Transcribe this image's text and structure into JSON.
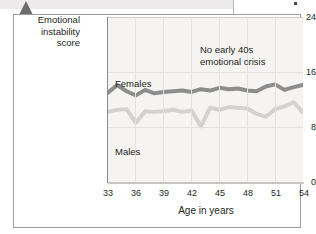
{
  "figure": {
    "y_axis_title_lines": [
      "Emotional",
      "instability",
      "score"
    ],
    "x_axis_label": "Age in years",
    "annotation_lines": [
      "No early 40s",
      "emotional crisis"
    ],
    "series_label_females": "Females",
    "series_label_males": "Males"
  },
  "colors": {
    "females_line": "#8d8d8d",
    "males_line": "#d3d2d0",
    "plot_background": "#f5f4f3",
    "gridline": "#e3e1df",
    "axis": "#8a8a8a",
    "frame": "#9d9d9d",
    "pointer": "#6c6c6c",
    "top_band": "#eceaea",
    "text": "#231f20"
  },
  "chart_data": {
    "type": "line",
    "title": "",
    "xlabel": "Age in years",
    "ylabel": "Emotional instability score",
    "xlim": [
      33,
      54
    ],
    "ylim": [
      0,
      24
    ],
    "yticks": [
      0,
      8,
      16,
      24
    ],
    "xticks": [
      33,
      36,
      39,
      42,
      45,
      48,
      51,
      54
    ],
    "grid": true,
    "legend": "inline-labels",
    "annotations": [
      {
        "text": "No early 40s emotional crisis",
        "x": 45.5,
        "y": 20.5
      }
    ],
    "x": [
      33,
      34,
      35,
      36,
      37,
      38,
      39,
      40,
      41,
      42,
      43,
      44,
      45,
      46,
      47,
      48,
      49,
      50,
      51,
      52,
      53,
      54
    ],
    "series": [
      {
        "name": "Females",
        "color": "#8d8d8d",
        "values": [
          13.0,
          14.1,
          13.2,
          12.6,
          13.4,
          12.9,
          13.1,
          13.2,
          13.3,
          13.1,
          13.5,
          13.3,
          13.7,
          13.5,
          13.6,
          13.3,
          13.2,
          13.9,
          14.2,
          13.4,
          13.8,
          14.1
        ]
      },
      {
        "name": "Males",
        "color": "#d3d2d0",
        "values": [
          10.2,
          10.5,
          10.6,
          8.6,
          10.3,
          10.2,
          10.3,
          10.5,
          10.2,
          10.4,
          8.1,
          10.8,
          10.5,
          10.9,
          10.8,
          10.7,
          9.9,
          9.5,
          10.6,
          11.0,
          11.6,
          10.1
        ]
      }
    ]
  }
}
